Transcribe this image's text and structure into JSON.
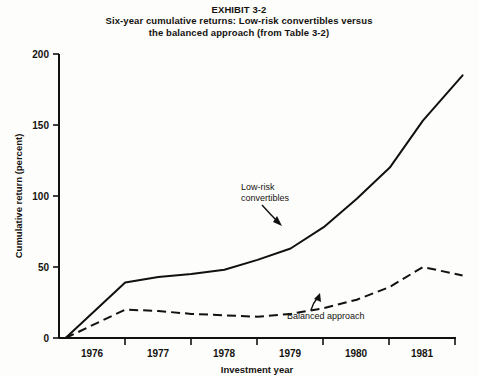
{
  "figure": {
    "exhibit_label": "EXHIBIT 3-2",
    "title_line_1": "Six-year cumulative returns: Low-risk convertibles versus",
    "title_line_2": "the balanced approach (from Table 3-2)"
  },
  "chart_data": {
    "type": "line",
    "title": "Six-year cumulative returns: Low-risk convertibles versus the balanced approach (from Table 3-2)",
    "xlabel": "Investment year",
    "ylabel": "Cumulative return (percent)",
    "xlim": [
      1975.5,
      1981.5
    ],
    "ylim": [
      0,
      200
    ],
    "yticks": [
      0,
      50,
      100,
      150,
      200
    ],
    "ytick_labels": [
      "0",
      "50",
      "100",
      "150",
      "200"
    ],
    "xtick_labels": [
      "1976",
      "1977",
      "1978",
      "1979",
      "1980",
      "1981"
    ],
    "grid": false,
    "legend": "annotations",
    "x": [
      1975.6,
      1976.5,
      1977.0,
      1977.5,
      1978.0,
      1978.5,
      1979.0,
      1979.5,
      1980.0,
      1980.5,
      1981.0,
      1981.6
    ],
    "series": [
      {
        "name": "Low-risk convertibles",
        "style": "solid",
        "color": "#111111",
        "values": [
          0,
          39,
          43,
          45,
          48,
          55,
          63,
          78,
          98,
          120,
          153,
          185
        ]
      },
      {
        "name": "Balanced approach",
        "style": "dashed",
        "color": "#111111",
        "values": [
          0,
          20,
          19,
          17,
          16,
          15,
          17,
          21,
          27,
          36,
          50,
          44
        ]
      }
    ],
    "annotations": [
      {
        "text_line_1": "Low-risk",
        "text_line_2": "convertibles",
        "target_series": "Low-risk convertibles"
      },
      {
        "text_line_1": "Balanced approach",
        "text_line_2": "",
        "target_series": "Balanced approach"
      }
    ]
  }
}
